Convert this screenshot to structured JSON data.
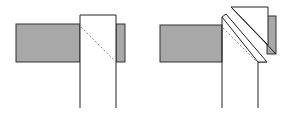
{
  "diagram": {
    "colors": {
      "fill_gray": "#a8a8a8",
      "stroke": "#222222",
      "background": "#ffffff",
      "dashed": "#888888"
    },
    "figures": [
      {
        "id": "left",
        "label": "",
        "type": "square-joint"
      },
      {
        "id": "right",
        "label": "",
        "type": "mitered-joint"
      }
    ]
  }
}
